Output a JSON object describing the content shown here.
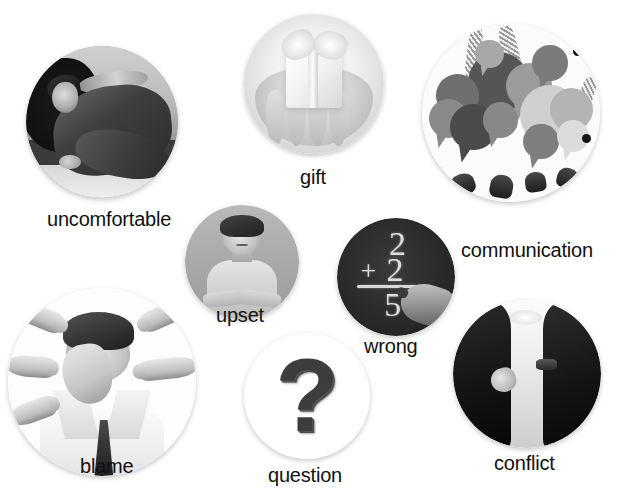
{
  "page": {
    "background_color": "#ffffff",
    "label_color": "#111111",
    "width": 627,
    "height": 493,
    "kind": "picture-vocabulary-collage"
  },
  "items": [
    {
      "id": "uncomfortable",
      "label": "uncomfortable",
      "image_alt": "woman crouched against a wall in a dark corner",
      "image_style": "black-and-white photo",
      "circle": {
        "left": 26,
        "top": 46,
        "size": 152
      },
      "label_pos": {
        "left": 47,
        "top": 208,
        "font_size": 20
      }
    },
    {
      "id": "gift",
      "label": "gift",
      "image_alt": "two hands holding a wrapped present with a bow",
      "image_style": "high-key black-and-white photo",
      "circle": {
        "left": 244,
        "top": 14,
        "size": 140
      },
      "label_pos": {
        "left": 300,
        "top": 166,
        "font_size": 20
      }
    },
    {
      "id": "communication",
      "label": "communication",
      "image_alt": "many overlapping speech bubbles held up by hands",
      "image_style": "grayscale illustration",
      "circle": {
        "left": 422,
        "top": 24,
        "size": 178
      },
      "label_pos": {
        "left": 461,
        "top": 239,
        "font_size": 20
      }
    },
    {
      "id": "upset",
      "label": "upset",
      "image_alt": "boy with arms folded frowning",
      "image_style": "grayscale studio photo",
      "circle": {
        "left": 185,
        "top": 205,
        "size": 114
      },
      "label_pos": {
        "left": 216,
        "top": 304,
        "font_size": 20
      }
    },
    {
      "id": "wrong",
      "label": "wrong",
      "image_alt": "blackboard sum 2 + 2 = 5 written in chalk with a hand",
      "image_style": "black-and-white photo",
      "circle": {
        "left": 337,
        "top": 218,
        "size": 118
      },
      "label_pos": {
        "left": 364,
        "top": 335,
        "font_size": 20
      }
    },
    {
      "id": "blame",
      "label": "blame",
      "image_alt": "man covering his face while many fingers point at him",
      "image_style": "black-and-white photo",
      "circle": {
        "left": 8,
        "top": 288,
        "size": 188
      },
      "label_pos": {
        "left": 80,
        "top": 455,
        "font_size": 20
      }
    },
    {
      "id": "question",
      "label": "question",
      "image_alt": "large three-dimensional question mark",
      "image_style": "grayscale 3D render",
      "circle": {
        "left": 244,
        "top": 333,
        "size": 126
      },
      "label_pos": {
        "left": 268,
        "top": 464,
        "font_size": 20
      }
    },
    {
      "id": "conflict",
      "label": "conflict",
      "image_alt": "two men in dark suits facing each other in a corridor",
      "image_style": "high-contrast black-and-white photo",
      "circle": {
        "left": 453,
        "top": 300,
        "size": 148
      },
      "label_pos": {
        "left": 494,
        "top": 452,
        "font_size": 20
      }
    }
  ],
  "wrong_board": {
    "line1": "2",
    "line2_operator": "+",
    "line2_number": "2",
    "result": "5"
  },
  "question_glyph": "?",
  "communication": {
    "bubble_shades": [
      "#6f6f6f",
      "#565656",
      "#8a8a8a",
      "#3f3f3f",
      "#a8a8a8",
      "#c6c6c6",
      "#767676",
      "#9b9b9b",
      "#4b4b4b",
      "#b4b4b4",
      "#dcdcdc",
      "#888888"
    ],
    "dot_count": 2
  }
}
